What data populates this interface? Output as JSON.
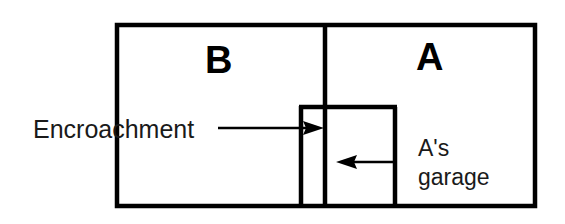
{
  "figure": {
    "type": "property-plat-diagram",
    "background_color": "#ffffff",
    "line_color": "#000000",
    "text_color": "#1a1a1a"
  },
  "parcels": {
    "left": {
      "label": "B",
      "name": "parcel-b"
    },
    "right": {
      "label": "A",
      "name": "parcel-a"
    }
  },
  "annotations": {
    "encroachment": {
      "label": "Encroachment",
      "arrow_direction": "right",
      "arrow_from_x": 218,
      "arrow_to_x": 322,
      "arrow_y": 128
    },
    "garage": {
      "line1": "A's",
      "line2": "garage",
      "arrow_direction": "left",
      "arrow_from_x": 396,
      "arrow_to_x": 337,
      "arrow_y": 162
    }
  },
  "geometry": {
    "outer_rect": {
      "x": 117,
      "y": 25,
      "width": 418,
      "height": 181
    },
    "party_line_x": 325,
    "garage_left_x": 300,
    "garage_right_x": 395,
    "garage_top_y": 107,
    "garage_bottom_y": 206,
    "outer_stroke_width": 4,
    "inner_stroke_width": 4
  },
  "icons": {
    "arrow_right": "arrow-right-icon",
    "arrow_left": "arrow-left-icon"
  }
}
